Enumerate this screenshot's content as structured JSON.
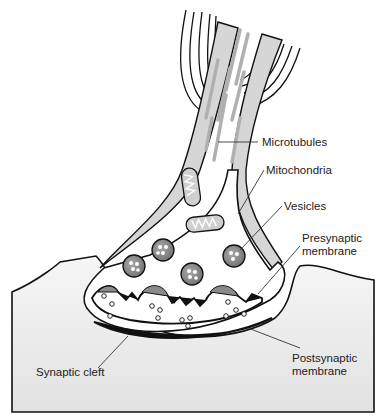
{
  "diagram": {
    "type": "synapse anatomy",
    "labels": {
      "microtubules": "Microtubules",
      "mitochondria": "Mitochondria",
      "vesicles": "Vesicles",
      "presynaptic_1": "Presynaptic",
      "presynaptic_2": "membrane",
      "postsynaptic_1": "Postsynaptic",
      "postsynaptic_2": "membrane",
      "synaptic_cleft": "Synaptic cleft"
    },
    "colors": {
      "outline": "#111111",
      "myelin_gray": "#d6d6d6",
      "vesicle_fill": "#8a8a8a",
      "postsynaptic_fill": "#e9e9e9",
      "membrane_black": "#111111"
    }
  }
}
